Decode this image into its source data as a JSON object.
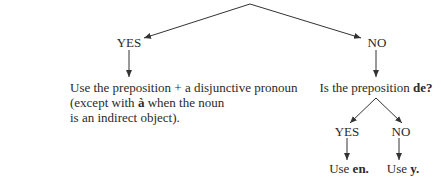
{
  "diagram": {
    "type": "decision-tree",
    "root": {
      "question": "",
      "branches": {
        "yes": {
          "label": "YES",
          "result_parts": [
            "Use the preposition + a disjunctive pronoun",
            "(except with ",
            "à",
            " when the noun",
            "is an indirect object)."
          ]
        },
        "no": {
          "label": "NO",
          "question_prefix": "Is the preposition ",
          "question_bold": "de?",
          "branches": {
            "yes": {
              "label": "YES",
              "result_prefix": "Use ",
              "result_bold": "en."
            },
            "no": {
              "label": "NO",
              "result_prefix": "Use ",
              "result_bold": "y."
            }
          }
        }
      }
    },
    "colors": {
      "text": "#2a2a2a",
      "line": "#333333",
      "background": "#ffffff"
    }
  }
}
